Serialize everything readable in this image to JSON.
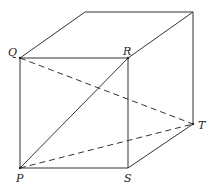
{
  "diagram": {
    "type": "cube",
    "labels": {
      "Q": "Q",
      "R": "R",
      "P": "P",
      "S": "S",
      "T": "T"
    },
    "solid_edges": [
      "QR",
      "RS",
      "SP",
      "PQ",
      "PR",
      "Q-top",
      "R-top",
      "top-back",
      "top-back-down-T",
      "S-T"
    ],
    "dashed_segments": [
      "QT",
      "PT"
    ],
    "line_color": "#333333"
  }
}
